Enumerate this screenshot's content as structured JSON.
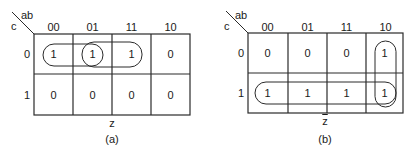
{
  "maps": [
    {
      "id": "a",
      "row_var": "c",
      "col_var": "ab",
      "col_headers": [
        "00",
        "01",
        "11",
        "10"
      ],
      "row_headers": [
        "0",
        "1"
      ],
      "cells": [
        [
          "1",
          "1",
          "1",
          "0"
        ],
        [
          "0",
          "0",
          "0",
          "0"
        ]
      ],
      "function_label": "z",
      "function_complemented": false,
      "caption": "(a)",
      "groups": [
        {
          "cells": "c=0, ab=00..01",
          "shape": "horizontal pill"
        },
        {
          "cells": "c=0, ab=01..11",
          "shape": "horizontal pill"
        }
      ]
    },
    {
      "id": "b",
      "row_var": "c",
      "col_var": "ab",
      "col_headers": [
        "00",
        "01",
        "11",
        "10"
      ],
      "row_headers": [
        "0",
        "1"
      ],
      "cells": [
        [
          "0",
          "0",
          "0",
          "1"
        ],
        [
          "1",
          "1",
          "1",
          "1"
        ]
      ],
      "function_label": "z",
      "function_complemented": true,
      "caption": "(b)",
      "groups": [
        {
          "cells": "c=1, ab=00..10",
          "shape": "horizontal pill"
        },
        {
          "cells": "ab=10, c=0..1",
          "shape": "vertical pill"
        }
      ]
    }
  ],
  "colors": {
    "line": "#2a2a2a",
    "background": "#ffffff"
  }
}
